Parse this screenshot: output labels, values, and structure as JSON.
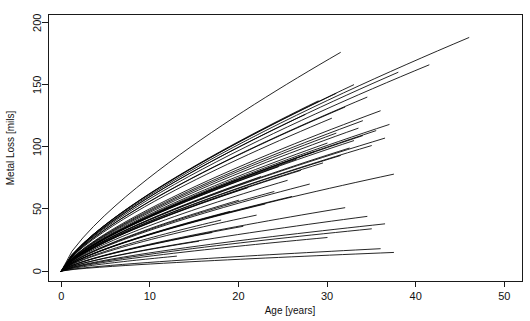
{
  "chart_data": {
    "type": "line",
    "title": "",
    "subtitle": "",
    "xlabel": "Age [years]",
    "ylabel": "Metal Loss [mils]",
    "xlim": [
      -1.5,
      52
    ],
    "ylim": [
      -8,
      207
    ],
    "xticks": [
      0,
      10,
      20,
      30,
      40,
      50
    ],
    "xticklabels": [
      "0",
      "10",
      "20",
      "30",
      "40",
      "50"
    ],
    "yticks": [
      0,
      50,
      100,
      150,
      200
    ],
    "yticklabels": [
      "0",
      "50",
      "100",
      "150",
      "200"
    ],
    "grid": false,
    "legend": null,
    "legend_position": "none",
    "box": true,
    "line_color": "#000000",
    "background_color": "#ffffff",
    "axis_color": "#1a1a1a",
    "n_series": 52,
    "x_start": 0,
    "y_start": 0,
    "curvature": 0.12,
    "series": [
      {
        "name": "unit-01",
        "x_end": 46.0,
        "y_end": 188.0
      },
      {
        "name": "unit-02",
        "x_end": 41.5,
        "y_end": 166.0
      },
      {
        "name": "unit-03",
        "x_end": 38.0,
        "y_end": 160.0
      },
      {
        "name": "unit-04",
        "x_end": 31.5,
        "y_end": 176.0
      },
      {
        "name": "unit-05",
        "x_end": 33.0,
        "y_end": 150.0
      },
      {
        "name": "unit-06",
        "x_end": 31.0,
        "y_end": 143.0
      },
      {
        "name": "unit-07",
        "x_end": 34.5,
        "y_end": 140.0
      },
      {
        "name": "unit-08",
        "x_end": 29.0,
        "y_end": 137.0
      },
      {
        "name": "unit-09",
        "x_end": 32.0,
        "y_end": 132.0
      },
      {
        "name": "unit-10",
        "x_end": 36.0,
        "y_end": 129.0
      },
      {
        "name": "unit-11",
        "x_end": 27.5,
        "y_end": 126.0
      },
      {
        "name": "unit-12",
        "x_end": 30.5,
        "y_end": 123.0
      },
      {
        "name": "unit-13",
        "x_end": 34.0,
        "y_end": 121.0
      },
      {
        "name": "unit-14",
        "x_end": 37.0,
        "y_end": 118.0
      },
      {
        "name": "unit-15",
        "x_end": 33.5,
        "y_end": 115.0
      },
      {
        "name": "unit-16",
        "x_end": 35.5,
        "y_end": 113.0
      },
      {
        "name": "unit-17",
        "x_end": 31.0,
        "y_end": 111.0
      },
      {
        "name": "unit-18",
        "x_end": 34.0,
        "y_end": 109.0
      },
      {
        "name": "unit-19",
        "x_end": 36.5,
        "y_end": 107.0
      },
      {
        "name": "unit-20",
        "x_end": 33.0,
        "y_end": 105.0
      },
      {
        "name": "unit-21",
        "x_end": 30.0,
        "y_end": 103.0
      },
      {
        "name": "unit-22",
        "x_end": 35.0,
        "y_end": 101.0
      },
      {
        "name": "unit-23",
        "x_end": 32.5,
        "y_end": 99.0
      },
      {
        "name": "unit-24",
        "x_end": 28.5,
        "y_end": 96.0
      },
      {
        "name": "unit-25",
        "x_end": 31.5,
        "y_end": 93.0
      },
      {
        "name": "unit-26",
        "x_end": 26.5,
        "y_end": 90.0
      },
      {
        "name": "unit-27",
        "x_end": 29.5,
        "y_end": 87.0
      },
      {
        "name": "unit-28",
        "x_end": 24.5,
        "y_end": 84.0
      },
      {
        "name": "unit-29",
        "x_end": 27.0,
        "y_end": 81.0
      },
      {
        "name": "unit-30",
        "x_end": 37.5,
        "y_end": 78.0
      },
      {
        "name": "unit-31",
        "x_end": 22.5,
        "y_end": 76.0
      },
      {
        "name": "unit-32",
        "x_end": 25.5,
        "y_end": 73.0
      },
      {
        "name": "unit-33",
        "x_end": 28.0,
        "y_end": 70.0
      },
      {
        "name": "unit-34",
        "x_end": 21.0,
        "y_end": 67.0
      },
      {
        "name": "unit-35",
        "x_end": 24.0,
        "y_end": 64.0
      },
      {
        "name": "unit-36",
        "x_end": 26.0,
        "y_end": 60.0
      },
      {
        "name": "unit-37",
        "x_end": 20.0,
        "y_end": 57.0
      },
      {
        "name": "unit-38",
        "x_end": 23.0,
        "y_end": 54.0
      },
      {
        "name": "unit-39",
        "x_end": 32.0,
        "y_end": 51.0
      },
      {
        "name": "unit-40",
        "x_end": 19.0,
        "y_end": 48.0
      },
      {
        "name": "unit-41",
        "x_end": 22.0,
        "y_end": 45.0
      },
      {
        "name": "unit-42",
        "x_end": 34.5,
        "y_end": 44.0
      },
      {
        "name": "unit-43",
        "x_end": 18.0,
        "y_end": 41.0
      },
      {
        "name": "unit-44",
        "x_end": 36.5,
        "y_end": 38.0
      },
      {
        "name": "unit-45",
        "x_end": 20.5,
        "y_end": 36.0
      },
      {
        "name": "unit-46",
        "x_end": 35.0,
        "y_end": 34.0
      },
      {
        "name": "unit-47",
        "x_end": 17.0,
        "y_end": 31.0
      },
      {
        "name": "unit-48",
        "x_end": 30.0,
        "y_end": 27.0
      },
      {
        "name": "unit-49",
        "x_end": 15.5,
        "y_end": 24.0
      },
      {
        "name": "unit-50",
        "x_end": 36.0,
        "y_end": 18.0
      },
      {
        "name": "unit-51",
        "x_end": 37.5,
        "y_end": 15.0
      },
      {
        "name": "unit-52",
        "x_end": 13.0,
        "y_end": 12.0
      }
    ]
  }
}
